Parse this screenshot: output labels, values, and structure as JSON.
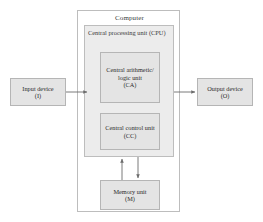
{
  "diagram": {
    "title": "Computer",
    "type": "block-diagram",
    "background_color": "#ffffff",
    "line_color": "#777777",
    "box_fill_color": "#e4e4e4",
    "box_border_color": "#b5b5b5",
    "frame_fill_color": "#ececec"
  },
  "computer": {
    "label": "Computer"
  },
  "cpu": {
    "label": "Central processing unit (CPU)"
  },
  "arithmetic_unit": {
    "line1": "Central arithmetic/",
    "line2": "logic unit",
    "line3": "(CA)"
  },
  "control_unit": {
    "line1": "Central control unit",
    "line2": "(CC)"
  },
  "memory_unit": {
    "line1": "Memory unit",
    "line2": "(M)"
  },
  "input_device": {
    "line1": "Input device",
    "line2": "(I)"
  },
  "output_device": {
    "line1": "Output device",
    "line2": "(O)"
  },
  "connections": [
    {
      "name": "input-to-cpu",
      "from": "Input device (I)",
      "to": "Central processing unit (CPU)",
      "direction": "right"
    },
    {
      "name": "cpu-to-output",
      "from": "Central processing unit (CPU)",
      "to": "Output device (O)",
      "direction": "right"
    },
    {
      "name": "memory-to-cpu",
      "from": "Memory unit (M)",
      "to": "Central processing unit (CPU)",
      "direction": "up"
    },
    {
      "name": "cpu-to-memory",
      "from": "Central processing unit (CPU)",
      "to": "Memory unit (M)",
      "direction": "down"
    }
  ]
}
